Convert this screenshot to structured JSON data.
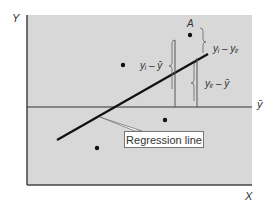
{
  "figure": {
    "axis_x_label": "X",
    "axis_y_label": "Y",
    "mean_label": "ȳ",
    "point_label_A": "A",
    "annotation_total": "yᵢ – ȳ",
    "annotation_residual": "yᵢ – yᵢᵣ",
    "annotation_explained": "yᵢᵣ – ȳ",
    "callout_text": "Regression line",
    "colors": {
      "plot_background": "#d8d8d8",
      "lines": "#111111",
      "text": "#333333"
    }
  }
}
